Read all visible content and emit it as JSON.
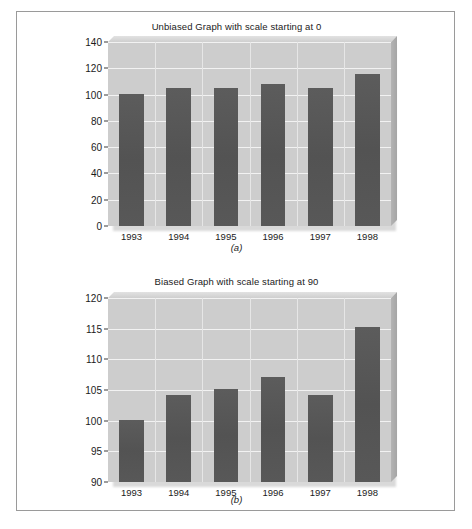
{
  "figure": {
    "panels": [
      {
        "id": "a",
        "panel_label": "(a)",
        "title": "Unbiased Graph with scale starting at 0"
      },
      {
        "id": "b",
        "panel_label": "(b)",
        "title": "Biased Graph with scale starting at 90"
      }
    ]
  },
  "colors": {
    "bar": "#565656",
    "plot_background": "#cdcdcd",
    "gridline": "#f2f2f2",
    "frame_border": "#9a9a9a",
    "page_background": "#ffffff",
    "text": "#1b1b1b"
  },
  "chart_data": [
    {
      "type": "bar",
      "title": "Unbiased Graph with scale starting at 0",
      "panel_label": "(a)",
      "categories": [
        "1993",
        "1994",
        "1995",
        "1996",
        "1997",
        "1998"
      ],
      "values": [
        100.2,
        104.8,
        105.2,
        108.4,
        105.2,
        116.0
      ],
      "xlabel": "",
      "ylabel": "",
      "ylim": [
        0,
        140
      ],
      "yticks": [
        0,
        20,
        40,
        60,
        80,
        100,
        120,
        140
      ],
      "ytick_labels": [
        "0",
        "20",
        "40",
        "60",
        "80",
        "100",
        "120",
        "140"
      ],
      "grid": true,
      "legend": false
    },
    {
      "type": "bar",
      "title": "Biased Graph with scale starting at 90",
      "panel_label": "(b)",
      "categories": [
        "1993",
        "1994",
        "1995",
        "1996",
        "1997",
        "1998"
      ],
      "values": [
        100.1,
        104.2,
        105.2,
        107.2,
        104.2,
        115.3
      ],
      "xlabel": "",
      "ylabel": "",
      "ylim": [
        90,
        120
      ],
      "yticks": [
        90,
        95,
        100,
        105,
        110,
        115,
        120
      ],
      "ytick_labels": [
        "90",
        "95",
        "100",
        "105",
        "110",
        "115",
        "120"
      ],
      "grid": true,
      "legend": false
    }
  ]
}
